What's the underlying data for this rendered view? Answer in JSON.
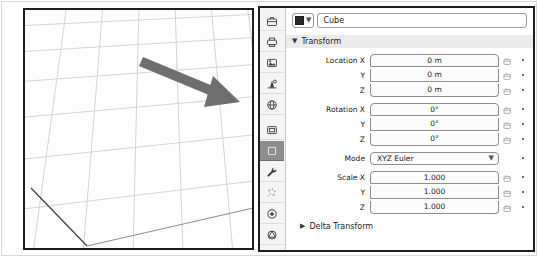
{
  "viewport": {
    "name": "3d-viewport",
    "background_color": "#fdfdfd",
    "grid_color": "#c9c9c9",
    "annotation": {
      "type": "arrow",
      "color": "#6e6e6e",
      "direction": "right-down"
    }
  },
  "properties_editor": {
    "tabs": [
      {
        "name": "tool-tab",
        "icon": "toolbox-icon",
        "active": false
      },
      {
        "name": "render-tab",
        "icon": "camera-back-icon",
        "active": false
      },
      {
        "name": "output-tab",
        "icon": "printer-icon",
        "active": false
      },
      {
        "name": "view-layer-tab",
        "icon": "images-icon",
        "active": false
      },
      {
        "name": "scene-tab",
        "icon": "cone-sphere-icon",
        "active": false
      },
      {
        "name": "world-tab",
        "icon": "globe-icon",
        "active": false
      },
      {
        "name": "collection-tab",
        "icon": "collection-box-icon",
        "active": false
      },
      {
        "name": "object-tab",
        "icon": "orange-square-icon",
        "active": true
      },
      {
        "name": "modifiers-tab",
        "icon": "wrench-icon",
        "active": false
      },
      {
        "name": "particles-tab",
        "icon": "particles-icon",
        "active": false
      },
      {
        "name": "physics-tab",
        "icon": "physics-orbit-icon",
        "active": false
      },
      {
        "name": "object-data-tab",
        "icon": "mesh-data-icon",
        "active": false
      }
    ],
    "object_name": {
      "label": "Cube",
      "placeholder": "Name",
      "id_icon": "object-id-icon"
    },
    "transform_panel": {
      "title": "Transform",
      "expanded": true,
      "chevron": "chevron-down-icon",
      "groups": [
        {
          "name": "location",
          "rows": [
            {
              "label": "Location X",
              "value": "0 m",
              "decorator": "animate-icon",
              "dot": true
            },
            {
              "label": "Y",
              "value": "0 m",
              "decorator": "animate-icon",
              "dot": true
            },
            {
              "label": "Z",
              "value": "0 m",
              "decorator": "animate-icon",
              "dot": true
            }
          ]
        },
        {
          "name": "rotation",
          "rows": [
            {
              "label": "Rotation X",
              "value": "0°",
              "decorator": "animate-icon",
              "dot": true
            },
            {
              "label": "Y",
              "value": "0°",
              "decorator": "animate-icon",
              "dot": true
            },
            {
              "label": "Z",
              "value": "0°",
              "decorator": "animate-icon",
              "dot": true
            }
          ]
        }
      ],
      "mode": {
        "label": "Mode",
        "value": "XYZ Euler",
        "chevron": "chevron-down-icon",
        "options": [
          "XYZ Euler",
          "XZY Euler",
          "YXZ Euler",
          "YZX Euler",
          "ZXY Euler",
          "ZYX Euler",
          "Axis Angle",
          "Quaternion (WXYZ)"
        ],
        "dot": true
      },
      "scale_group": {
        "name": "scale",
        "rows": [
          {
            "label": "Scale X",
            "value": "1.000",
            "decorator": "animate-icon",
            "dot": true
          },
          {
            "label": "Y",
            "value": "1.000",
            "decorator": "animate-icon",
            "dot": true
          },
          {
            "label": "Z",
            "value": "1.000",
            "decorator": "animate-icon",
            "dot": true
          }
        ]
      }
    },
    "delta_transform_panel": {
      "title": "Delta Transform",
      "expanded": false,
      "chevron": "chevron-right-icon"
    }
  }
}
